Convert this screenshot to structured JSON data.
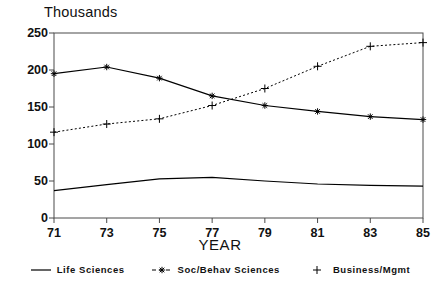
{
  "chart_data": {
    "type": "line",
    "title": "",
    "unit_label": "Thousands",
    "xlabel": "YEAR",
    "ylabel": "",
    "categories": [
      "71",
      "73",
      "75",
      "77",
      "79",
      "81",
      "83",
      "85"
    ],
    "x": [
      71,
      73,
      75,
      77,
      79,
      81,
      83,
      85
    ],
    "xlim": [
      71,
      85
    ],
    "ylim": [
      0,
      250
    ],
    "yticks": [
      0,
      50,
      100,
      150,
      200,
      250
    ],
    "xticks": [
      71,
      73,
      75,
      77,
      79,
      81,
      83,
      85
    ],
    "grid": false,
    "legend_position": "bottom",
    "series": [
      {
        "name": "Life Sciences",
        "marker": "line",
        "style": "solid",
        "color": "#000000",
        "values": [
          37,
          45,
          53,
          55,
          50,
          46,
          44,
          43
        ]
      },
      {
        "name": "Soc/Behav Sciences",
        "marker": "star",
        "style": "solid",
        "color": "#000000",
        "values": [
          195,
          204,
          189,
          165,
          152,
          144,
          137,
          133
        ]
      },
      {
        "name": "Business/Mgmt",
        "marker": "plus",
        "style": "dotted",
        "color": "#000000",
        "values": [
          116,
          127,
          134,
          152,
          175,
          205,
          232,
          237
        ]
      }
    ]
  },
  "axis": {
    "y_tick_labels": [
      "250",
      "200",
      "150",
      "100",
      "50",
      "0"
    ],
    "x_tick_labels": [
      "71",
      "73",
      "75",
      "77",
      "79",
      "81",
      "83",
      "85"
    ],
    "x_title": "YEAR",
    "unit_label": "Thousands"
  },
  "legend": {
    "items": [
      {
        "label": "Life Sciences",
        "marker": "line-marker"
      },
      {
        "label": "Soc/Behav Sciences",
        "marker": "star-marker"
      },
      {
        "label": "Business/Mgmt",
        "marker": "plus-marker"
      }
    ]
  }
}
